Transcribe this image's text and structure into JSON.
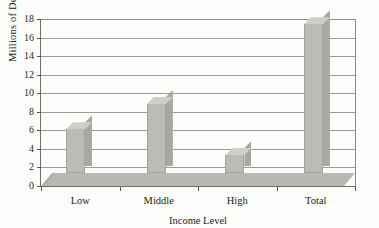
{
  "chart_data": {
    "type": "bar",
    "title": "",
    "categories": [
      "Low",
      "Middle",
      "High",
      "Total"
    ],
    "values": [
      5.7,
      8.4,
      2.9,
      17.0
    ],
    "xlabel": "Income Level",
    "ylabel": "Millions of Deaths",
    "ylim": [
      0,
      18
    ],
    "ytick_step": 2,
    "yticks": [
      "18",
      "16",
      "14",
      "12",
      "10",
      "8",
      "6",
      "4",
      "2",
      "0"
    ],
    "grid": true,
    "legend": false,
    "style": "3d-bar",
    "colors": {
      "bar_front": "#bcbcb7",
      "bar_top": "#cfcfca",
      "bar_side": "#a8a8a3",
      "floor": "#b9b9b4",
      "gridline": "#9a9a96",
      "background": "#fdfdfb",
      "text": "#22211c"
    }
  }
}
